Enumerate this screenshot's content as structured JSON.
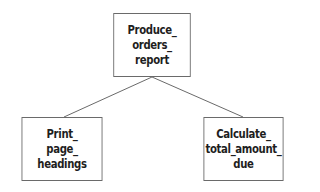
{
  "diagram": {
    "type": "hierarchy-chart",
    "nodes": [
      {
        "id": "root",
        "label": "Produce_\norders_\nreport",
        "x": 108,
        "y": 13,
        "w": 88,
        "h": 64
      },
      {
        "id": "left",
        "label": "Print_\npage_\nheadings",
        "x": 16,
        "y": 117,
        "w": 92,
        "h": 64
      },
      {
        "id": "right",
        "label": "Calculate_\ntotal_amount_\ndue",
        "x": 198,
        "y": 117,
        "w": 91,
        "h": 64
      }
    ],
    "edges": [
      {
        "from": "root",
        "to": "left"
      },
      {
        "from": "root",
        "to": "right"
      }
    ],
    "colors": {
      "line": "#6a6a6a",
      "text": "#1e1e1e",
      "background": "#ffffff"
    }
  }
}
